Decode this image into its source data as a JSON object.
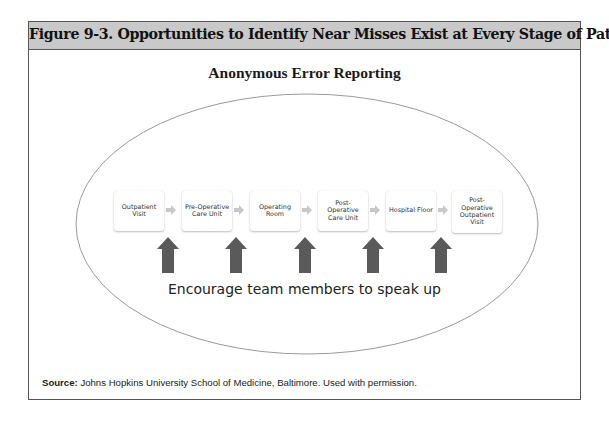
{
  "figure": {
    "title": "Figure 9-3. Opportunities to Identify Near Misses Exist at Every Stage of Patient Care",
    "header_bg": "#c9c9c9"
  },
  "diagram": {
    "heading": "Anonymous Error Reporting",
    "container_shape": "ellipse",
    "steps": [
      {
        "label": "Outpatient Visit"
      },
      {
        "label": "Pre-Operative Care Unit"
      },
      {
        "label": "Operating Room"
      },
      {
        "label": "Post-Operative Care Unit"
      },
      {
        "label": "Hospital Floor"
      },
      {
        "label": "Post-Operative Outpatient Visit"
      }
    ],
    "connector_icon": "right-arrow-icon",
    "upward_arrow_icon": "up-arrow-icon",
    "upward_arrow_count": 5,
    "upward_arrow_color": "#5a5a5a",
    "caption": "Encourage team members to speak up"
  },
  "source": {
    "label": "Source:",
    "text": " Johns Hopkins University School of Medicine, Baltimore. Used with permission."
  }
}
